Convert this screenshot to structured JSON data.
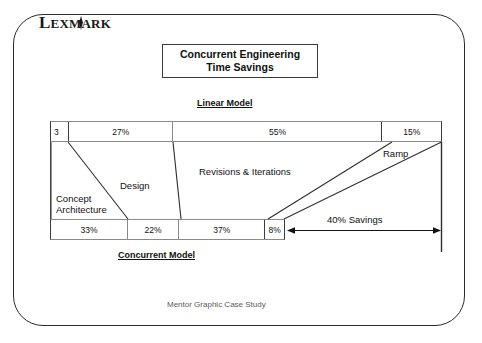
{
  "brand": {
    "logo_text_parts": [
      "L",
      "EXM",
      "A",
      "RK"
    ],
    "logo_name": "LEXMARK"
  },
  "title": {
    "line1": "Concurrent Engineering",
    "line2": "Time Savings"
  },
  "captions": {
    "linear": "Linear Model",
    "concurrent": "Concurrent Model"
  },
  "linear_bar": {
    "segments": [
      {
        "label": "3",
        "width_pct": 4.6
      },
      {
        "label": "27%",
        "width_pct": 26.8
      },
      {
        "label": "55%",
        "width_pct": 53.6
      },
      {
        "label": "15%",
        "width_pct": 15.0
      }
    ]
  },
  "concurrent_bar": {
    "segments": [
      {
        "label": "33%",
        "width_pct": 33.0
      },
      {
        "label": "22%",
        "width_pct": 22.0
      },
      {
        "label": "37%",
        "width_pct": 37.0
      },
      {
        "label": "8%",
        "width_pct": 8.0
      }
    ]
  },
  "phase_labels": {
    "concept_line1": "Concept",
    "concept_line2": "Architecture",
    "design": "Design",
    "revisions": "Revisions & Iterations",
    "ramp": "Ramp"
  },
  "annotations": {
    "savings": "40% Savings"
  },
  "footer": {
    "source": "Mentor Graphic Case Study"
  },
  "colors": {
    "ink": "#111111",
    "frame": "#2b2b2b",
    "rule": "#8a8a8a",
    "footer": "#5a5a5a"
  }
}
